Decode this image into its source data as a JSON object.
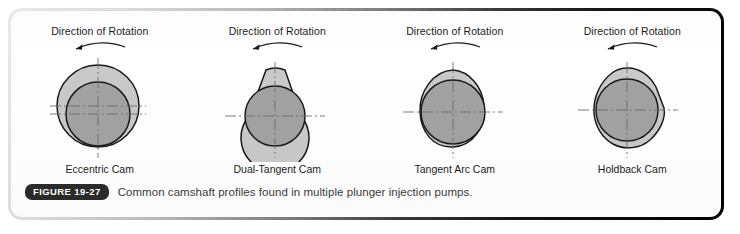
{
  "figure": {
    "badge": "FIGURE 19-27",
    "caption": "Common camshaft profiles found in multiple plunger injection pumps."
  },
  "colors": {
    "cam_outer_fill": "#c9c9c9",
    "cam_inner_fill": "#a2a2a2",
    "outline": "#1a1a1a",
    "centerline": "#6e6e6e",
    "text": "#1b1b1b",
    "caption_text": "#3b3b3b",
    "badge_bg": "#2b2b2b",
    "badge_text": "#ffffff"
  },
  "cams": [
    {
      "rotation_label": "Direction of Rotation",
      "rotation_direction": "counterclockwise",
      "arrow_icon": "curved-arrow-left-icon",
      "name": "Eccentric Cam",
      "profile": "circle",
      "centerlines": "two-horizontal-one-vertical"
    },
    {
      "rotation_label": "Direction of Rotation",
      "rotation_direction": "counterclockwise",
      "arrow_icon": "curved-arrow-left-icon",
      "name": "Dual-Tangent Cam",
      "profile": "teardrop-flat-top",
      "centerlines": "one-horizontal-one-vertical"
    },
    {
      "rotation_label": "Direction of Rotation",
      "rotation_direction": "counterclockwise",
      "arrow_icon": "curved-arrow-left-icon",
      "name": "Tangent Arc Cam",
      "profile": "rounded-lobe",
      "centerlines": "one-horizontal-one-vertical"
    },
    {
      "rotation_label": "Direction of Rotation",
      "rotation_direction": "counterclockwise",
      "arrow_icon": "curved-arrow-left-icon",
      "name": "Holdback Cam",
      "profile": "irregular-polygonal-lobe",
      "centerlines": "one-horizontal-one-vertical"
    }
  ]
}
